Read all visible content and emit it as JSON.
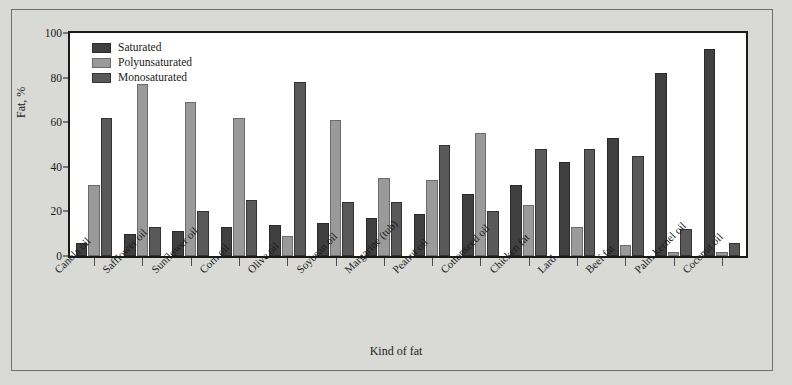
{
  "chart_data": {
    "type": "bar",
    "title": "",
    "xlabel": "Kind of fat",
    "ylabel": "Fat, %",
    "ylim": [
      0,
      100
    ],
    "yticks": [
      0,
      20,
      40,
      60,
      80,
      100
    ],
    "grid": false,
    "legend_position": "upper-left-inside",
    "categories": [
      "Canola oil",
      "Safflower oil",
      "Sunflower oil",
      "Corn oil",
      "Olive oil",
      "Soybean oil",
      "Margarine (tub)",
      "Peanut oil",
      "Cottonseed oil",
      "Chicken fat",
      "Lard",
      "Beef fat",
      "Palm kernel oil",
      "Coconut oil"
    ],
    "series": [
      {
        "name": "Saturated",
        "color": "#404040",
        "values": [
          6,
          10,
          11,
          13,
          14,
          15,
          17,
          19,
          28,
          32,
          42,
          53,
          82,
          93
        ]
      },
      {
        "name": "Polyunsaturated",
        "color": "#9a9a9a",
        "values": [
          32,
          77,
          69,
          62,
          9,
          61,
          35,
          34,
          55,
          23,
          13,
          5,
          2,
          2
        ]
      },
      {
        "name": "Monosaturated",
        "color": "#595959",
        "values": [
          62,
          13,
          20,
          25,
          78,
          24,
          24,
          50,
          20,
          48,
          48,
          45,
          12,
          6
        ]
      }
    ]
  },
  "legend": {
    "items": [
      {
        "label": "Saturated"
      },
      {
        "label": "Polyunsaturated"
      },
      {
        "label": "Monosaturated"
      }
    ]
  },
  "axis": {
    "y_title": "Fat, %",
    "x_title": "Kind of fat",
    "y_tick_labels": [
      "0",
      "20",
      "40",
      "60",
      "80",
      "100"
    ]
  }
}
